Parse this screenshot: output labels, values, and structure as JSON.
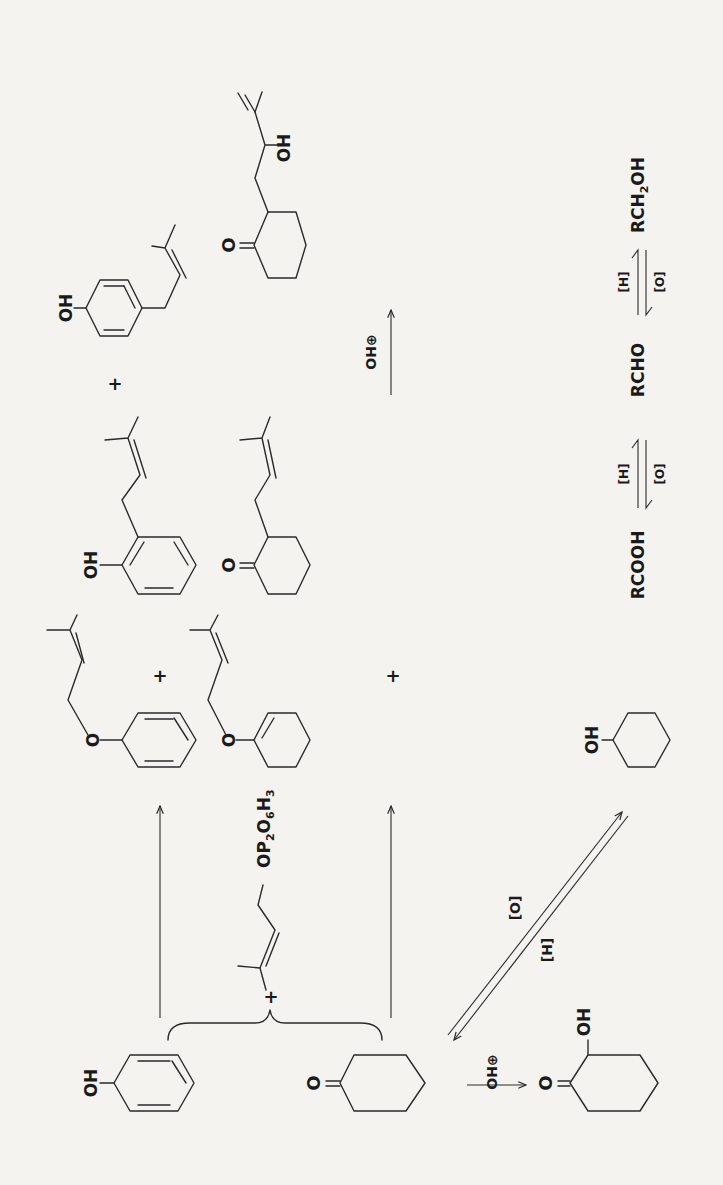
{
  "figure": {
    "orientation": "rotated 90deg counter-clockwise (landscape scheme on portrait page)",
    "reactants": {
      "phenol": {
        "name": "Phenol",
        "label": "OH"
      },
      "cyclohexanone": {
        "name": "Cyclohexanone",
        "label": "O"
      },
      "plus": "+",
      "prenyl_reagent": {
        "name": "Dimethylallyl pyrophosphate",
        "label": "OP2O6H3",
        "label_parts": [
          "OP",
          "2",
          "O",
          "6",
          "H",
          "3"
        ]
      }
    },
    "row_phenol_products": {
      "ether": {
        "name": "Phenyl prenyl ether",
        "label": "O"
      },
      "plus_1": "+",
      "ortho": {
        "name": "2-Prenylphenol",
        "label": "OH"
      },
      "plus_2": "+",
      "para": {
        "name": "4-Prenylphenol",
        "label": "OH"
      }
    },
    "row_ketone_products": {
      "enol_ether": {
        "name": "Prenyl cyclohexenyl ether",
        "label": "O"
      },
      "plus": "+",
      "alkyl_ketone": {
        "name": "2-Prenylcyclohexanone",
        "label": "O"
      },
      "arrow_reagent": "OH⊕",
      "hydroxy_product": {
        "name": "2-(2-Hydroxy-3-methylbut-3-enyl)cyclohexanone",
        "labels": [
          "O",
          "OH"
        ]
      }
    },
    "bottom_scheme": {
      "hydroxylation_reagent": "OH⊕",
      "hydroxyketone": {
        "name": "2-Hydroxycyclohexanone",
        "labels": [
          "O",
          "OH"
        ]
      },
      "redox_upper": "[O]",
      "redox_lower": "[H]",
      "cyclohexanol": {
        "name": "Cyclohexanol",
        "label": "OH"
      }
    },
    "redox_series": {
      "species": [
        "RCOOH",
        "RCHO",
        "RCH2OH"
      ],
      "arrow_upper": "[H]",
      "arrow_lower": "[O]",
      "rch2oh_parts": [
        "RCH",
        "2",
        "OH"
      ]
    }
  }
}
